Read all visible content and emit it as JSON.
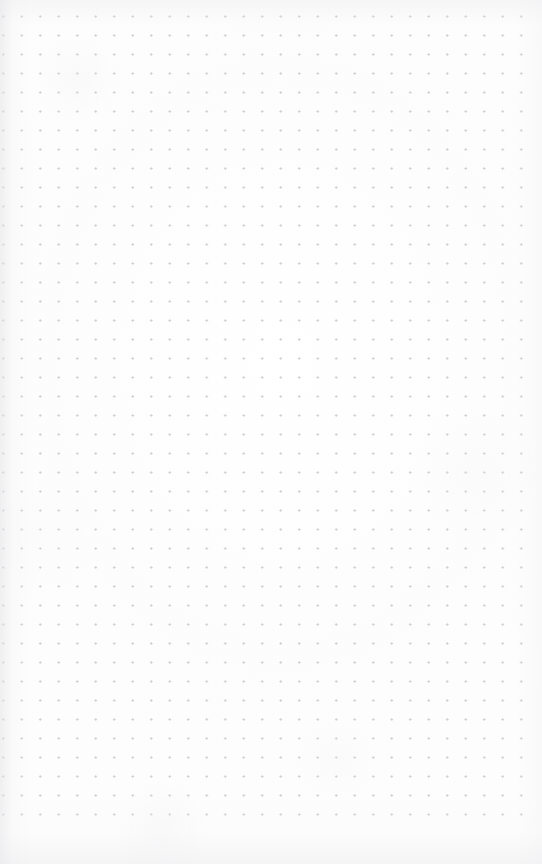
{
  "page": {
    "kind": "dot-grid-notebook-page",
    "width": 542,
    "height": 864,
    "paper_color": "#fdfdfd",
    "content_text": "",
    "annotations": []
  },
  "grid": {
    "dot_color": "#c9c9ce",
    "dot_size_px": 1.6,
    "spacing_x_px": 18.5,
    "spacing_y_px": 19.0,
    "offset_left_px": 31,
    "offset_top_px": 26,
    "columns": 27,
    "rows": 42,
    "margin_right_px": 30,
    "margin_bottom_px": 46
  },
  "shadows": {
    "left_edge_color": "#e4e4e7",
    "top_edge_color": "#ebebee",
    "bottom_edge_color": "#e9e9ec",
    "right_edge_color": "#f0f0f3"
  }
}
